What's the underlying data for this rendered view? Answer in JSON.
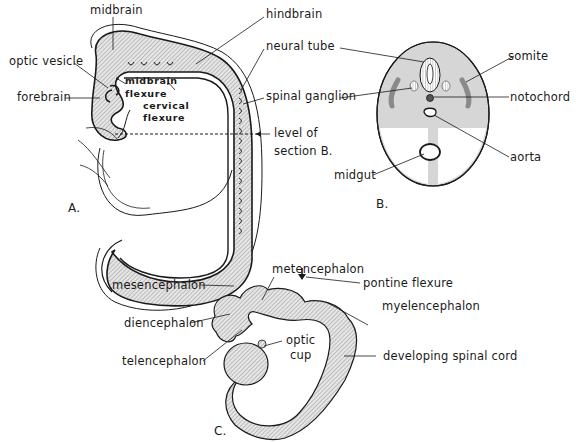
{
  "panels": {
    "A": {
      "panel_label": "A.",
      "labels": {
        "midbrain": "midbrain",
        "hindbrain": "hindbrain",
        "optic_vesicle": "optic vesicle",
        "forebrain": "forebrain",
        "neural_tube": "neural tube",
        "midbrain_flexure_1": "midbrain",
        "midbrain_flexure_2": "flexure",
        "cervical_flexure_1": "cervical",
        "cervical_flexure_2": "flexure",
        "spinal_ganglion": "spinal ganglion",
        "level_of_1": "level of",
        "level_of_2": "section B."
      }
    },
    "B": {
      "panel_label": "B.",
      "labels": {
        "somite": "somite",
        "notochord": "notochord",
        "aorta": "aorta",
        "midgut": "midgut"
      }
    },
    "C": {
      "panel_label": "C.",
      "labels": {
        "metencephalon": "metencephalon",
        "pontine_flexure": "pontine flexure",
        "mesencephalon": "mesencephalon",
        "myelencephalon": "myelencephalon",
        "diencephalon": "diencephalon",
        "optic_cup_1": "optic",
        "optic_cup_2": "cup",
        "telencephalon": "telencephalon",
        "developing_spinal_cord": "developing spinal cord"
      }
    }
  },
  "colors": {
    "line": "#1a1a1a",
    "tissue_fill": "#d9d9d9",
    "hatch": "#8a8a8a",
    "background": "#ffffff"
  }
}
